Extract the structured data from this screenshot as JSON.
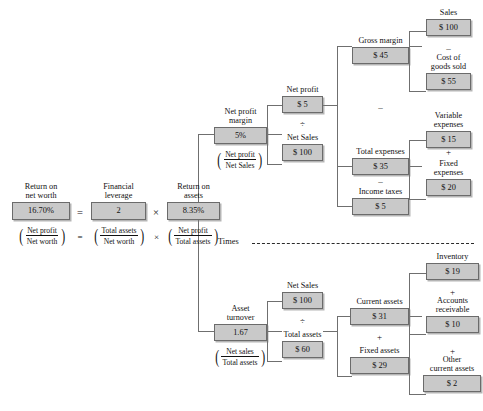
{
  "diagram": {
    "box_fill": "#c9c9c9",
    "box_border": "#6b6b6b",
    "line_color": "#6f6f6f"
  },
  "operators": {
    "equals": "=",
    "times": "×",
    "divide": "÷",
    "plus": "+",
    "minus": "–"
  },
  "separator": {
    "label": "Times"
  },
  "nodes": {
    "return_on_net_worth": {
      "label": "Return on\nnet worth",
      "value": "16.70%"
    },
    "financial_leverage": {
      "label": "Financial\nleverage",
      "value": "2"
    },
    "return_on_assets": {
      "label": "Return on\nassets",
      "value": "8.35%"
    },
    "net_profit_margin": {
      "label": "Net profit\nmargin",
      "value": "5%"
    },
    "asset_turnover": {
      "label": "Asset\nturnover",
      "value": "1.67"
    },
    "net_profit": {
      "label": "Net profit",
      "value": "$ 5"
    },
    "net_sales_mid": {
      "label": "Net Sales",
      "value": "$ 100"
    },
    "net_sales_low": {
      "label": "Net Sales",
      "value": "$ 100"
    },
    "total_assets_low": {
      "label": "Total assets",
      "value": "$ 60"
    },
    "gross_margin": {
      "label": "Gross margin",
      "value": "$ 45"
    },
    "total_expenses": {
      "label": "Total expenses",
      "value": "$ 35"
    },
    "income_taxes": {
      "label": "Income taxes",
      "value": "$ 5"
    },
    "sales": {
      "label": "Sales",
      "value": "$ 100"
    },
    "cost_of_goods_sold": {
      "label": "Cost of\ngoods sold",
      "value": "$ 55"
    },
    "variable_expenses": {
      "label": "Variable\nexpenses",
      "value": "$ 15"
    },
    "fixed_expenses": {
      "label": "Fixed\nexpenses",
      "value": "$ 20"
    },
    "current_assets": {
      "label": "Current assets",
      "value": "$ 31"
    },
    "fixed_assets": {
      "label": "Fixed assets",
      "value": "$ 29"
    },
    "inventory": {
      "label": "Inventory",
      "value": "$ 19"
    },
    "accounts_receivable": {
      "label": "Accounts\nreceivable",
      "value": "$ 10"
    },
    "other_current_assets": {
      "label": "Other\ncurrent assets",
      "value": "$ 2"
    }
  },
  "fractions": {
    "ronw": {
      "numerator": "Net profit",
      "denominator": "Net worth"
    },
    "leverage": {
      "numerator": "Total assets",
      "denominator": "Net worth"
    },
    "roa": {
      "numerator": "Net profit",
      "denominator": "Total assets"
    },
    "profit_margin": {
      "numerator": "Net profit",
      "denominator": "Net Sales"
    },
    "turnover": {
      "numerator": "Net sales",
      "denominator": "Total assets"
    }
  },
  "chart_data": {
    "type": "diagram",
    "subtype": "dupont-tree",
    "root": "return_on_net_worth",
    "relations": [
      {
        "parent": "return_on_net_worth",
        "operator": "=",
        "children": [
          "financial_leverage",
          "return_on_assets"
        ],
        "child_operator": "×"
      },
      {
        "parent": "return_on_assets",
        "operator": "=",
        "children": [
          "net_profit_margin",
          "asset_turnover"
        ],
        "child_operator": "Times"
      },
      {
        "parent": "net_profit_margin",
        "operator": "=",
        "children": [
          "net_profit",
          "net_sales_mid"
        ],
        "child_operator": "÷"
      },
      {
        "parent": "asset_turnover",
        "operator": "=",
        "children": [
          "net_sales_low",
          "total_assets_low"
        ],
        "child_operator": "÷"
      },
      {
        "parent": "net_profit",
        "operator": "=",
        "children": [
          "gross_margin",
          "total_expenses",
          "income_taxes"
        ],
        "child_operator": "–"
      },
      {
        "parent": "gross_margin",
        "operator": "=",
        "children": [
          "sales",
          "cost_of_goods_sold"
        ],
        "child_operator": "–"
      },
      {
        "parent": "total_expenses",
        "operator": "=",
        "children": [
          "variable_expenses",
          "fixed_expenses"
        ],
        "child_operator": "+"
      },
      {
        "parent": "total_assets_low",
        "operator": "=",
        "children": [
          "current_assets",
          "fixed_assets"
        ],
        "child_operator": "+"
      },
      {
        "parent": "current_assets",
        "operator": "=",
        "children": [
          "inventory",
          "accounts_receivable",
          "other_current_assets"
        ],
        "child_operator": "+"
      }
    ],
    "values": {
      "return_on_net_worth": 16.7,
      "financial_leverage": 2,
      "return_on_assets": 8.35,
      "net_profit_margin": 5,
      "asset_turnover": 1.67,
      "net_profit": 5,
      "net_sales": 100,
      "total_assets": 60,
      "gross_margin": 45,
      "total_expenses": 35,
      "income_taxes": 5,
      "sales": 100,
      "cost_of_goods_sold": 55,
      "variable_expenses": 15,
      "fixed_expenses": 20,
      "current_assets": 31,
      "fixed_assets": 29,
      "inventory": 19,
      "accounts_receivable": 10,
      "other_current_assets": 2
    }
  }
}
